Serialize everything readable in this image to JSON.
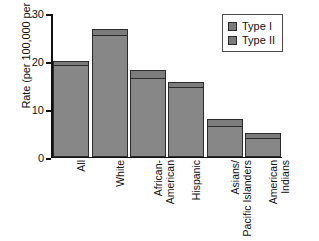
{
  "chart_data": {
    "type": "bar",
    "subtype": "stacked-bar",
    "title": "",
    "xlabel": "",
    "ylabel": "Rate (per 100,000 per year)",
    "ylim": [
      0,
      30
    ],
    "yticks": [
      0,
      10,
      20,
      30
    ],
    "ytick_labels": [
      "0",
      "10",
      "20",
      "30"
    ],
    "grid": false,
    "legend_position": "top-right",
    "categories": [
      "All",
      "White",
      "African-\nAmerican",
      "Hispanic",
      "Asians/\nPacific Islanders",
      "American\nIndians"
    ],
    "series": [
      {
        "name": "Type I",
        "values": [
          19.0,
          25.3,
          16.3,
          14.4,
          6.3,
          3.8
        ],
        "color": "#878787"
      },
      {
        "name": "Type II",
        "values": [
          1.0,
          1.2,
          1.7,
          1.1,
          1.5,
          1.1
        ],
        "color": "#7c7c7c"
      }
    ],
    "totals": [
      20.0,
      26.5,
      18.0,
      15.5,
      7.8,
      4.9
    ]
  },
  "legend": {
    "entries": [
      {
        "label": "Type I",
        "swatch": "#7c7c7c"
      },
      {
        "label": "Type II",
        "swatch": "#7c7c7c"
      }
    ]
  },
  "axes": {
    "y_title": "Rate (per 100,000 per year)"
  }
}
